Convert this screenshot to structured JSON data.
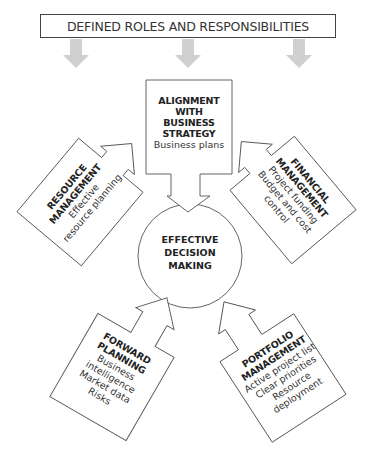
{
  "banner": {
    "label": "DEFINED ROLES AND RESPONSIBILITIES"
  },
  "banner_arrows": {
    "count": 3,
    "color": "#d0d0d0"
  },
  "center": {
    "line1": "EFFECTIVE",
    "line2": "DECISION",
    "line3": "MAKING"
  },
  "nodes": {
    "alignment": {
      "title1": "ALIGNMENT",
      "title2": "WITH",
      "title3": "BUSINESS",
      "title4": "STRATEGY",
      "sub1": "Business plans"
    },
    "resource": {
      "title1": "RESOURCE",
      "title2": "MANAGEMENT",
      "sub1": "Effective",
      "sub2": "resource planning"
    },
    "financial": {
      "title1": "FINANCIAL",
      "title2": "MANAGEMENT",
      "sub1": "Project funding",
      "sub2": "Budget and cost",
      "sub3": "control"
    },
    "forward": {
      "title1": "FORWARD",
      "title2": "PLANNING",
      "sub1": "Business",
      "sub2": "intelligence",
      "sub3": "Market data",
      "sub4": "Risks"
    },
    "portfolio": {
      "title1": "PORTFOLIO",
      "title2": "MANAGEMENT",
      "sub1": "Active project list",
      "sub2": "Clear priorities",
      "sub3": "Resource",
      "sub4": "deployment"
    }
  },
  "colors": {
    "stroke": "#555555",
    "text": "#222222",
    "arrow_gray": "#d0d0d0"
  }
}
